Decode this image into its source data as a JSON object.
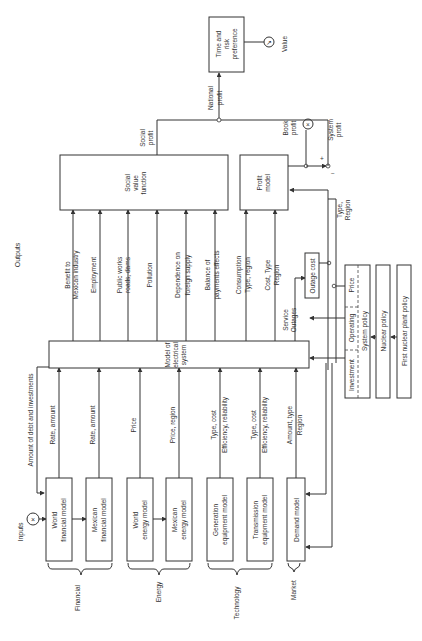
{
  "figure": {
    "orientation": "rotated-90-ccw",
    "inputs_label": "Inputs",
    "outputs_label": "Outputs",
    "value_label": "Value"
  },
  "groups": [
    {
      "label": "Financial"
    },
    {
      "label": "Energy"
    },
    {
      "label": "Technology"
    },
    {
      "label": "Market"
    }
  ],
  "input_models": [
    {
      "line1": "World",
      "line2": "financial model",
      "output": [
        "Rate, amount",
        ""
      ]
    },
    {
      "line1": "Mexican",
      "line2": "financial model",
      "output": [
        "Rate, amount",
        ""
      ]
    },
    {
      "line1": "World",
      "line2": "energy model",
      "output": [
        "Price",
        ""
      ]
    },
    {
      "line1": "Mexican",
      "line2": "energy model",
      "output": [
        "Price, region",
        ""
      ]
    },
    {
      "line1": "Generation",
      "line2": "equipment model",
      "output": [
        "Type, cost",
        "Efficiency, reliability"
      ]
    },
    {
      "line1": "Transmission",
      "line2": "equipment model",
      "output": [
        "Type, cost",
        "Efficiency, reliability"
      ]
    },
    {
      "line1": "Demand model",
      "line2": "",
      "output": [
        "Amount, type",
        "Region"
      ]
    }
  ],
  "feedback_label": "Amount of debt and investments",
  "central_model": {
    "line1": "Model of",
    "line2": "electrical",
    "line3": "system"
  },
  "social_outputs": [
    {
      "line1": "Benefit to",
      "line2": "Mexican industry"
    },
    {
      "line1": "Employment",
      "line2": ""
    },
    {
      "line1": "Public works",
      "line2": "roads, dams"
    },
    {
      "line1": "Pollution",
      "line2": ""
    },
    {
      "line1": "Dependence on",
      "line2": "foreign supply"
    },
    {
      "line1": "Balance of",
      "line2": "payments effects"
    }
  ],
  "profit_outputs": [
    {
      "line1": "Consumption",
      "line2": "Type, region"
    },
    {
      "line1": "Cost, Type",
      "line2": "Region"
    },
    {
      "line1": "Service",
      "line2": "Outages"
    }
  ],
  "social_value": {
    "line1": "Social",
    "line2": "value",
    "line3": "function",
    "out1": "Social",
    "out2": "profit"
  },
  "profit_model": {
    "line1": "Profit",
    "line2": "model",
    "book1": "Book",
    "book2": "profit",
    "plus": "+",
    "minus": "−",
    "sys1": "System",
    "sys2": "profit"
  },
  "outage_cost": {
    "label": "Outage cost"
  },
  "type_region": {
    "line1": "Type,",
    "line2": "Region"
  },
  "national_profit": {
    "line1": "National",
    "line2": "profit"
  },
  "time_risk": {
    "line1": "Time and",
    "line2": "risk",
    "line3": "preference"
  },
  "policies": {
    "system_policy": {
      "investment": "Investment",
      "operating": "Operating",
      "price": "Price",
      "label": "System policy"
    },
    "nuclear": "Nuclear policy",
    "first_nuclear": "First nuclear plant policy"
  }
}
